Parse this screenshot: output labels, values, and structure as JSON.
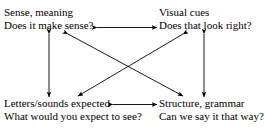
{
  "diagram": {
    "line_color": "#000000",
    "background_color": "#ffffff",
    "nodes": [
      {
        "id": "sense",
        "position": "top-left",
        "heading": "Sense, meaning",
        "question": "Does it make sense?"
      },
      {
        "id": "visual",
        "position": "top-right",
        "heading": "Visual cues",
        "question": "Does that look right?"
      },
      {
        "id": "letters",
        "position": "bottom-left",
        "heading": "Letters/sounds expected",
        "question": "What would you expect to see?"
      },
      {
        "id": "structure",
        "position": "bottom-right",
        "heading": "Structure, grammar",
        "question": "Can we say it that way?"
      }
    ],
    "connectors": [
      {
        "id": "top-horizontal",
        "from": "sense",
        "to": "visual",
        "style": "double-headed",
        "orientation": "horizontal"
      },
      {
        "id": "bottom-horizontal",
        "from": "letters",
        "to": "structure",
        "style": "double-headed",
        "orientation": "horizontal"
      },
      {
        "id": "left-vertical",
        "from": "sense",
        "to": "letters",
        "style": "double-headed",
        "orientation": "vertical"
      },
      {
        "id": "right-vertical",
        "from": "visual",
        "to": "structure",
        "style": "double-headed",
        "orientation": "vertical"
      },
      {
        "id": "diagonal-sense-structure",
        "from": "sense",
        "to": "structure",
        "style": "double-headed",
        "orientation": "diagonal"
      },
      {
        "id": "diagonal-visual-letters",
        "from": "visual",
        "to": "letters",
        "style": "double-headed",
        "orientation": "diagonal"
      }
    ]
  }
}
